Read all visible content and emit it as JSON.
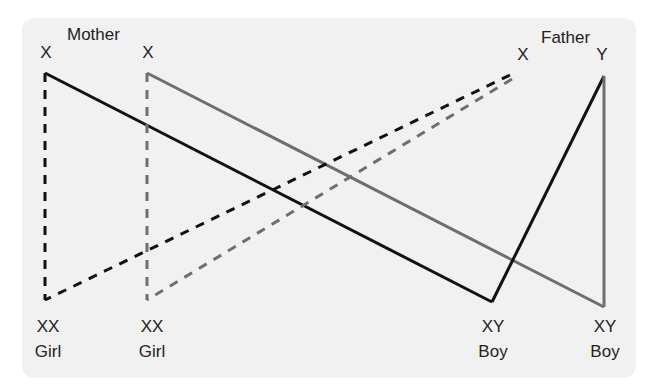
{
  "parents": {
    "mother": {
      "label": "Mother",
      "chromosomes": [
        "X",
        "X"
      ]
    },
    "father": {
      "label": "Father",
      "chromosomes": [
        "X",
        "Y"
      ]
    }
  },
  "offspring": [
    {
      "genotype": "XX",
      "sex": "Girl"
    },
    {
      "genotype": "XX",
      "sex": "Girl"
    },
    {
      "genotype": "XY",
      "sex": "Boy"
    },
    {
      "genotype": "XY",
      "sex": "Boy"
    }
  ],
  "colors": {
    "panel": "#f1f1f1",
    "line_black": "#111111",
    "line_gray": "#6e6e6e",
    "text": "#222222"
  },
  "lines": [
    {
      "name": "mother-x1-to-girl1",
      "style": "dashed",
      "color": "black"
    },
    {
      "name": "mother-x1-to-boy1",
      "style": "solid",
      "color": "black"
    },
    {
      "name": "mother-x2-to-girl2",
      "style": "dashed",
      "color": "gray"
    },
    {
      "name": "mother-x2-to-boy2",
      "style": "solid",
      "color": "gray"
    },
    {
      "name": "father-x-to-girl1",
      "style": "dashed",
      "color": "black"
    },
    {
      "name": "father-x-to-girl2",
      "style": "dashed",
      "color": "gray"
    },
    {
      "name": "father-y-to-boy1",
      "style": "solid",
      "color": "black"
    },
    {
      "name": "father-y-to-boy2",
      "style": "solid",
      "color": "gray"
    }
  ]
}
